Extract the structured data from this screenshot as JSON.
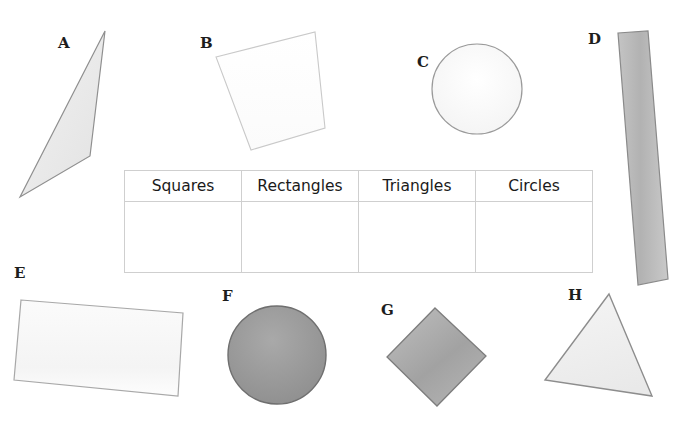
{
  "page": {
    "background_color": "#ffffff",
    "width": 694,
    "height": 421
  },
  "table": {
    "name": "shape-sorting-table",
    "headers": [
      "Squares",
      "Rectangles",
      "Triangles",
      "Circles"
    ],
    "rows": [
      [
        "",
        "",
        "",
        ""
      ]
    ],
    "border_color": "#cfcfcf",
    "header_text_color": "#1a1a1a"
  },
  "shapes": [
    {
      "label": "A",
      "kind": "triangle",
      "name": "shape-a-triangle",
      "fill": "#ececec",
      "stroke": "#8f8f8f",
      "points": "105,31 90,156 20,197",
      "label_x": 58,
      "label_y": 36
    },
    {
      "label": "B",
      "kind": "square",
      "name": "shape-b-square",
      "fill": "#fdfdfd",
      "stroke": "#c9c9c9",
      "points": "216,57 315,32 325,128 251,150",
      "label_x": 200,
      "label_y": 36
    },
    {
      "label": "C",
      "kind": "circle",
      "name": "shape-c-circle",
      "fill": "#fafafa",
      "stroke": "#9a9a9a",
      "cx": 477,
      "cy": 89,
      "r": 45,
      "label_x": 417,
      "label_y": 55
    },
    {
      "label": "D",
      "kind": "rectangle",
      "name": "shape-d-rectangle",
      "fill": "#b9b9b9",
      "stroke": "#8a8a8a",
      "points": "618,33 648,31 668,279 638,285",
      "label_x": 588,
      "label_y": 32
    },
    {
      "label": "E",
      "kind": "rectangle",
      "name": "shape-e-rectangle",
      "fill": "#f7f7f7",
      "stroke": "#a8a8a8",
      "points": "21,300 183,313 178,396 14,380",
      "label_x": 14,
      "label_y": 266
    },
    {
      "label": "F",
      "kind": "circle",
      "name": "shape-f-circle",
      "fill": "#9c9c9c",
      "stroke": "#6f6f6f",
      "cx": 277,
      "cy": 355,
      "r": 49,
      "label_x": 222,
      "label_y": 289
    },
    {
      "label": "G",
      "kind": "square",
      "name": "shape-g-square",
      "fill": "#ababab",
      "stroke": "#7d7d7d",
      "points": "435,308 486,356 437,406 387,357",
      "label_x": 381,
      "label_y": 303
    },
    {
      "label": "H",
      "kind": "triangle",
      "name": "shape-h-triangle",
      "fill": "#eeeeee",
      "stroke": "#8d8d8d",
      "points": "609,294 652,396 545,380",
      "label_x": 568,
      "label_y": 288
    }
  ]
}
